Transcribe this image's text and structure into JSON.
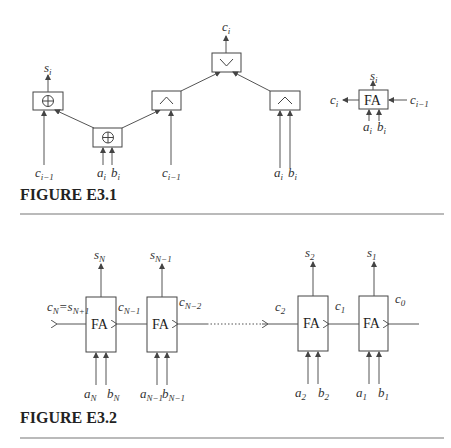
{
  "figure1": {
    "caption": "FIGURE E3.1",
    "gates": {
      "xor_out": {
        "symbol": "⊕",
        "output": "s",
        "output_sub": "i"
      },
      "xor_in": {
        "symbol": "⊕"
      },
      "and_carry": {
        "symbol": "∧"
      },
      "or_out": {
        "symbol": "∨",
        "output": "c",
        "output_sub": "i"
      },
      "and_ab": {
        "symbol": "∧"
      }
    },
    "inputs": [
      {
        "name": "c",
        "sub": "i−1"
      },
      {
        "name": "a",
        "sub": "i"
      },
      {
        "name": "b",
        "sub": "i"
      },
      {
        "name": "c",
        "sub": "i−1"
      },
      {
        "name": "a",
        "sub": "i"
      },
      {
        "name": "b",
        "sub": "i"
      }
    ],
    "fa_block": {
      "label": "FA",
      "out_top": {
        "name": "s",
        "sub": "i"
      },
      "out_left": {
        "name": "c",
        "sub": "i"
      },
      "in_right": {
        "name": "c",
        "sub": "i−1"
      },
      "in_a": {
        "name": "a",
        "sub": "i"
      },
      "in_b": {
        "name": "b",
        "sub": "i"
      }
    }
  },
  "figure2": {
    "caption": "FIGURE E3.2",
    "blocks": [
      {
        "label": "FA",
        "sum": "s",
        "sum_sub": "N",
        "a": "a",
        "a_sub": "N",
        "b": "b",
        "b_sub": "N",
        "carry_in": "c",
        "carry_in_sub": "N−1"
      },
      {
        "label": "FA",
        "sum": "s",
        "sum_sub": "N−1",
        "a": "a",
        "a_sub": "N−1",
        "b": "b",
        "b_sub": "N−1",
        "carry_in": "c",
        "carry_in_sub": "N−2"
      },
      {
        "label": "FA",
        "sum": "s",
        "sum_sub": "2",
        "a": "a",
        "a_sub": "2",
        "b": "b",
        "b_sub": "2",
        "carry_in": "c",
        "carry_in_sub": "1"
      },
      {
        "label": "FA",
        "sum": "s",
        "sum_sub": "1",
        "a": "a",
        "a_sub": "1",
        "b": "b",
        "b_sub": "1",
        "carry_in": "c",
        "carry_in_sub": "0"
      }
    ],
    "carry_out": {
      "c": "c",
      "c_sub": "N",
      "eq": "=",
      "s": "s",
      "s_sub": "N+1"
    },
    "c2_label": {
      "name": "c",
      "sub": "2"
    }
  }
}
